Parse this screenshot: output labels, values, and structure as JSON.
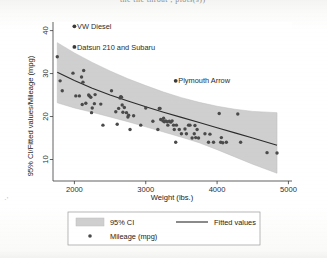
{
  "page": {
    "top_cut_text": "the the throat ; plots(s))",
    "corner_mark": "·'"
  },
  "chart_data": {
    "type": "scatter",
    "title": "",
    "xlabel": "Weight (lbs.)",
    "ylabel": "95% CI/Fitted values/Mileage (mpg)",
    "xlim": [
      1700,
      5050
    ],
    "ylim": [
      5.0,
      42.0
    ],
    "xticks": [
      2000,
      3000,
      4000,
      5000
    ],
    "xticklabels": [
      "2000",
      "3000",
      "4000",
      "5000"
    ],
    "yticks": [
      10,
      20,
      30,
      40
    ],
    "yticklabels": [
      "10",
      "20",
      "30",
      "40"
    ],
    "grid": false,
    "legend_position": "below-plot",
    "series": [
      {
        "name": "95% CI",
        "type": "band",
        "color": "#cfcfcf",
        "x": [
          1760,
          2000,
          2250,
          2500,
          2750,
          3000,
          3250,
          3500,
          3750,
          4000,
          4250,
          4500,
          4840
        ],
        "y_low": [
          23.2,
          22.0,
          21.0,
          19.9,
          18.8,
          17.6,
          16.4,
          15.2,
          13.9,
          12.3,
          10.6,
          8.9,
          6.8
        ],
        "y_high": [
          37.2,
          34.8,
          32.6,
          30.6,
          28.8,
          27.2,
          25.7,
          24.4,
          23.3,
          22.4,
          21.7,
          21.2,
          20.9
        ]
      },
      {
        "name": "Fitted values",
        "type": "line",
        "color": "#2b2b2b",
        "x": [
          1760,
          2000,
          2250,
          2500,
          2750,
          3000,
          3250,
          3500,
          3750,
          4000,
          4250,
          4500,
          4840
        ],
        "y": [
          30.3,
          28.4,
          26.6,
          25.0,
          23.6,
          22.3,
          21.0,
          19.8,
          18.6,
          17.4,
          16.2,
          15.0,
          13.3
        ]
      },
      {
        "name": "Mileage (mpg)",
        "type": "points",
        "color": "#4a4a4a",
        "points": [
          [
            1760,
            33.9
          ],
          [
            1800,
            28.3
          ],
          [
            1830,
            26.0
          ],
          [
            1980,
            30.1
          ],
          [
            2020,
            24.8
          ],
          [
            2070,
            24.8
          ],
          [
            2100,
            29.2
          ],
          [
            2110,
            22.8
          ],
          [
            2120,
            28.0
          ],
          [
            2130,
            30.7
          ],
          [
            2160,
            23.1
          ],
          [
            2200,
            25.0
          ],
          [
            2210,
            24.8
          ],
          [
            2230,
            24.5
          ],
          [
            2240,
            20.9
          ],
          [
            2250,
            22.0
          ],
          [
            2280,
            23.0
          ],
          [
            2290,
            25.1
          ],
          [
            2370,
            22.9
          ],
          [
            2400,
            18.0
          ],
          [
            2520,
            26.0
          ],
          [
            2580,
            21.1
          ],
          [
            2600,
            18.2
          ],
          [
            2620,
            21.9
          ],
          [
            2640,
            24.3
          ],
          [
            2650,
            24.6
          ],
          [
            2660,
            24.5
          ],
          [
            2670,
            22.7
          ],
          [
            2680,
            21.0
          ],
          [
            2700,
            22.1
          ],
          [
            2730,
            20.9
          ],
          [
            2750,
            19.9
          ],
          [
            2760,
            20.3
          ],
          [
            2780,
            17.0
          ],
          [
            2830,
            20.2
          ],
          [
            2930,
            18.0
          ],
          [
            3000,
            22.0
          ],
          [
            3100,
            18.9
          ],
          [
            3170,
            17.0
          ],
          [
            3190,
            21.9
          ],
          [
            3200,
            21.9
          ],
          [
            3210,
            19.3
          ],
          [
            3240,
            19.0
          ],
          [
            3250,
            19.6
          ],
          [
            3260,
            18.8
          ],
          [
            3280,
            19.0
          ],
          [
            3300,
            18.8
          ],
          [
            3310,
            18.0
          ],
          [
            3330,
            18.9
          ],
          [
            3350,
            18.7
          ],
          [
            3370,
            19.0
          ],
          [
            3390,
            18.0
          ],
          [
            3400,
            17.0
          ],
          [
            3420,
            14.0
          ],
          [
            3430,
            18.0
          ],
          [
            3470,
            17.0
          ],
          [
            3500,
            16.0
          ],
          [
            3550,
            17.1
          ],
          [
            3570,
            16.0
          ],
          [
            3600,
            18.0
          ],
          [
            3620,
            18.0
          ],
          [
            3650,
            15.0
          ],
          [
            3680,
            16.0
          ],
          [
            3690,
            17.9
          ],
          [
            3700,
            15.1
          ],
          [
            3720,
            17.0
          ],
          [
            3740,
            15.0
          ],
          [
            3830,
            16.0
          ],
          [
            3880,
            14.0
          ],
          [
            3900,
            15.9
          ],
          [
            3950,
            14.0
          ],
          [
            4030,
            20.7
          ],
          [
            4050,
            14.0
          ],
          [
            4060,
            15.1
          ],
          [
            4080,
            13.9
          ],
          [
            4130,
            14.0
          ],
          [
            4290,
            20.6
          ],
          [
            4330,
            14.0
          ],
          [
            4700,
            11.6
          ],
          [
            4840,
            11.5
          ]
        ]
      }
    ],
    "annotations": [
      {
        "label": "VW Diesel",
        "x": 2000,
        "y": 41.0,
        "marker_x": 2000,
        "marker_y": 41.0
      },
      {
        "label": "Datsun 210 and Subaru",
        "x": 2000,
        "y": 36.2,
        "marker_x": 2000,
        "marker_y": 36.2
      },
      {
        "label": "Plymouth Arrow",
        "x": 3420,
        "y": 28.3,
        "marker_x": 3420,
        "marker_y": 28.3
      }
    ],
    "legend": [
      {
        "key": "band",
        "label": "95% CI"
      },
      {
        "key": "line",
        "label": "Fitted values"
      },
      {
        "key": "dot",
        "label": "Mileage (mpg)"
      }
    ]
  },
  "colors": {
    "band": "#cfcfcf",
    "band_edge": "#bdbdbd",
    "line": "#2b2b2b",
    "point": "#4a4a4a",
    "axis": "#3a3a3a",
    "legend_border": "#9a9a9a",
    "background": "#ffffff"
  }
}
